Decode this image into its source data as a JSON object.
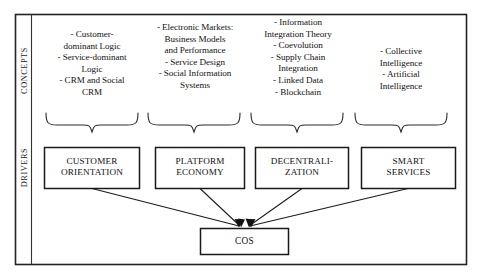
{
  "figure": {
    "kind": "framework-diagram",
    "colors": {
      "ink": "#111111",
      "frame": "#222222",
      "box_border": "#1a1a1a",
      "background": "#ffffff",
      "brace": "#2b2b2b"
    }
  },
  "rows": {
    "concepts_label": "CONCEPTS",
    "drivers_label": "DRIVERS"
  },
  "concepts": [
    {
      "id": "customer-orientation-concepts",
      "lines": [
        "- Customer-",
        "dominant Logic",
        "- Service-dominant",
        "Logic",
        "- CRM and Social",
        "CRM"
      ]
    },
    {
      "id": "platform-economy-concepts",
      "lines": [
        "- Electronic Markets:",
        "Business Models",
        "and Performance",
        "- Service Design",
        "- Social Information",
        "Systems"
      ]
    },
    {
      "id": "decentralization-concepts",
      "lines": [
        "- Information",
        "Integration Theory",
        "- Coevolution",
        "- Supply Chain",
        "Integration",
        "- Linked Data",
        "- Blockchain"
      ]
    },
    {
      "id": "smart-services-concepts",
      "lines": [
        "- Collective",
        "Intelligence",
        "- Artificial",
        "Intelligence"
      ]
    }
  ],
  "drivers": [
    {
      "id": "customer-orientation",
      "lines": [
        "CUSTOMER",
        "ORIENTATION"
      ]
    },
    {
      "id": "platform-economy",
      "lines": [
        "PLATFORM",
        "ECONOMY"
      ]
    },
    {
      "id": "decentralization",
      "lines": [
        "DECENTRALI-",
        "ZATION"
      ]
    },
    {
      "id": "smart-services",
      "lines": [
        "SMART",
        "SERVICES"
      ]
    }
  ],
  "outcome": {
    "id": "cos",
    "label": "COS"
  }
}
